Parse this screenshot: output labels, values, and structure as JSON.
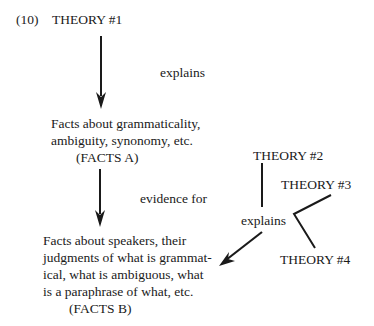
{
  "example_number": "(10)",
  "theory1": "THEORY #1",
  "theory2": "THEORY #2",
  "theory3": "THEORY #3",
  "theory4": "THEORY #4",
  "edge_explains_1": "explains",
  "edge_evidence_for": "evidence for",
  "edge_explains_2": "explains",
  "facts_a": {
    "lines": [
      "Facts about grammaticality,",
      "ambiguity, synonomy, etc."
    ],
    "label": "(FACTS A)"
  },
  "facts_b": {
    "lines": [
      "Facts about speakers, their",
      "judgments of what is grammat-",
      "ical, what is ambiguous, what",
      "is a paraphrase of what, etc."
    ],
    "label": "(FACTS B)"
  },
  "colors": {
    "ink": "#1a1a1a",
    "background": "#ffffff"
  }
}
